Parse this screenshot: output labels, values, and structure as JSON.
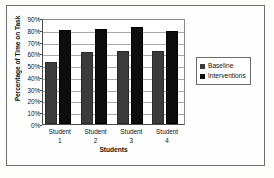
{
  "chart_data": {
    "type": "bar",
    "title": "",
    "xlabel": "Students",
    "ylabel": "Percentage of Time on Task",
    "categories": [
      "Student 1",
      "Student 2",
      "Student 3",
      "Student 4"
    ],
    "category_lines": [
      {
        "line1": "Student",
        "line2": "1"
      },
      {
        "line1": "Student",
        "line2": "2"
      },
      {
        "line1": "Student",
        "line2": "3"
      },
      {
        "line1": "Student",
        "line2": "4"
      }
    ],
    "series": [
      {
        "name": "Baseline",
        "color": "#3b3b3b",
        "values": [
          53,
          61,
          62,
          62
        ]
      },
      {
        "name": "Interventions",
        "color": "#0d0d0d",
        "values": [
          80,
          81,
          82,
          79
        ]
      }
    ],
    "ylim": [
      0,
      90
    ],
    "ytick_step": 10,
    "ytick_labels": [
      "90%",
      "80%",
      "70%",
      "60%",
      "50%",
      "40%",
      "30%",
      "20%",
      "10%",
      "0%"
    ],
    "ytick_values": [
      90,
      80,
      70,
      60,
      50,
      40,
      30,
      20,
      10,
      0
    ],
    "grid": true,
    "legend_position": "right"
  },
  "legend": {
    "entries": [
      {
        "label": "Baseline",
        "swatch": "baseline-swatch-icon"
      },
      {
        "label": "Interventions",
        "swatch": "interventions-swatch-icon"
      }
    ]
  }
}
